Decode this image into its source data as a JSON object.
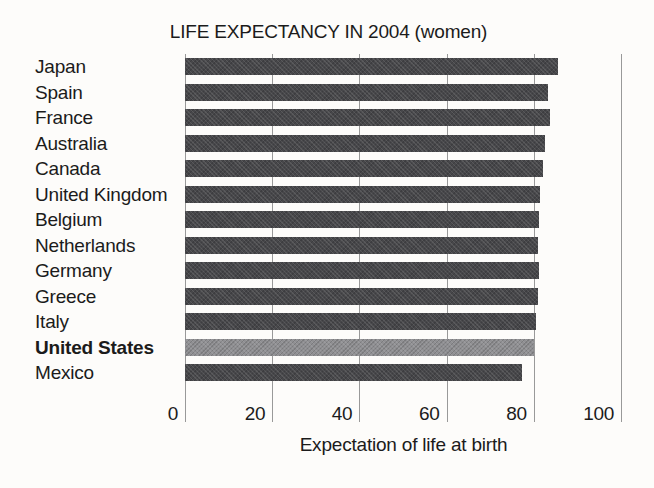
{
  "chart_data": {
    "type": "bar",
    "orientation": "horizontal",
    "title": "LIFE EXPECTANCY IN 2004 (women)",
    "xlabel": "Expectation of life at birth",
    "ylabel": "",
    "xlim": [
      0,
      100
    ],
    "xticks": [
      0,
      20,
      40,
      60,
      80,
      100
    ],
    "gridlines": "vertical, drawn behind bars and visible in row gaps",
    "legend": false,
    "categories": [
      "Japan",
      "Spain",
      "France",
      "Australia",
      "Canada",
      "United Kingdom",
      "Belgium",
      "Netherlands",
      "Germany",
      "Greece",
      "Italy",
      "United States",
      "Mexico"
    ],
    "values": [
      85.5,
      83.3,
      83.8,
      82.6,
      82.2,
      81.3,
      81.2,
      81.0,
      81.2,
      81.0,
      80.5,
      80.0,
      77.3
    ],
    "highlighted_category": "United States",
    "highlight_note": "United States label is bold and its bar is a lighter gray than the others"
  },
  "colors": {
    "paper": "#fdfcfa",
    "ink": "#1b1b1b",
    "bar": "#47474a",
    "bar_highlight": "#8f8f92",
    "gridline": "#999999"
  }
}
